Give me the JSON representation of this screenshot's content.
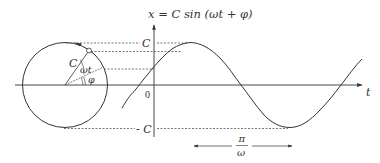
{
  "diagram": {
    "title_equation": "x = C sin (ωt + φ)",
    "labels": {
      "y_axis_top": "C",
      "y_axis_bottom": "- C",
      "origin": "0",
      "x_axis": "t",
      "radius": "C",
      "angle_omega_t": "ωt",
      "angle_phi": "φ",
      "half_period_numerator": "π",
      "half_period_denominator": "ω"
    },
    "colors": {
      "stroke": "#333333",
      "dashes": "#555555",
      "background": "#ffffff"
    }
  }
}
